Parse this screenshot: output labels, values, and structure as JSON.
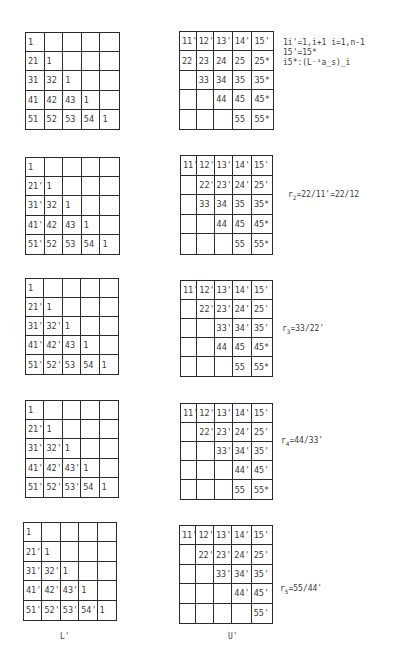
{
  "steps": [
    {
      "L": [
        [
          "1",
          "",
          "",
          "",
          ""
        ],
        [
          "21",
          "1",
          "",
          "",
          ""
        ],
        [
          "31",
          "32",
          "1",
          "",
          ""
        ],
        [
          "41",
          "42",
          "43",
          "1",
          ""
        ],
        [
          "51",
          "52",
          "53",
          "54",
          "1"
        ]
      ],
      "U": [
        [
          "11'",
          "12'",
          "13'",
          "14'",
          "15'"
        ],
        [
          "22",
          "23",
          "24",
          "25",
          "25*"
        ],
        [
          "",
          "33",
          "34",
          "35",
          "35*"
        ],
        [
          "",
          "",
          "44",
          "45",
          "45*"
        ],
        [
          "",
          "",
          "",
          "55",
          "55*"
        ]
      ],
      "note_lines": [
        "1i'=1,i+1 i=1,n-1",
        "15'=15*",
        "i5*:(L⁻¹a_s)_i"
      ]
    },
    {
      "L": [
        [
          "1",
          "",
          "",
          "",
          ""
        ],
        [
          "21'",
          "1",
          "",
          "",
          ""
        ],
        [
          "31'",
          "32",
          "1",
          "",
          ""
        ],
        [
          "41'",
          "42",
          "43",
          "1",
          ""
        ],
        [
          "51'",
          "52",
          "53",
          "54",
          "1"
        ]
      ],
      "U": [
        [
          "11'",
          "12'",
          "13'",
          "14'",
          "15'"
        ],
        [
          "",
          "22'",
          "23'",
          "24'",
          "25'"
        ],
        [
          "",
          "33",
          "34",
          "35",
          "35*"
        ],
        [
          "",
          "",
          "44",
          "45",
          "45*"
        ],
        [
          "",
          "",
          "",
          "55",
          "55*"
        ]
      ],
      "note": {
        "r": "r",
        "sub": "2",
        "expr": "=22/11'=22/12"
      }
    },
    {
      "L": [
        [
          "1",
          "",
          "",
          "",
          ""
        ],
        [
          "21'",
          "1",
          "",
          "",
          ""
        ],
        [
          "31'",
          "32'",
          "1",
          "",
          ""
        ],
        [
          "41'",
          "42'",
          "43",
          "1",
          ""
        ],
        [
          "51'",
          "52'",
          "53",
          "54",
          "1"
        ]
      ],
      "U": [
        [
          "11'",
          "12'",
          "13'",
          "14'",
          "15'"
        ],
        [
          "",
          "22'",
          "23'",
          "24'",
          "25'"
        ],
        [
          "",
          "",
          "33'",
          "34'",
          "35'"
        ],
        [
          "",
          "",
          "44",
          "45",
          "45*"
        ],
        [
          "",
          "",
          "",
          "55",
          "55*"
        ]
      ],
      "note": {
        "r": "r",
        "sub": "3",
        "expr": "=33/22'"
      }
    },
    {
      "L": [
        [
          "1",
          "",
          "",
          "",
          ""
        ],
        [
          "21'",
          "1",
          "",
          "",
          ""
        ],
        [
          "31'",
          "32'",
          "1",
          "",
          ""
        ],
        [
          "41'",
          "42'",
          "43'",
          "1",
          ""
        ],
        [
          "51'",
          "52'",
          "53'",
          "54",
          "1"
        ]
      ],
      "U": [
        [
          "11'",
          "12'",
          "13'",
          "14'",
          "15'"
        ],
        [
          "",
          "22'",
          "23'",
          "24'",
          "25'"
        ],
        [
          "",
          "",
          "33'",
          "34'",
          "35'"
        ],
        [
          "",
          "",
          "",
          "44'",
          "45'"
        ],
        [
          "",
          "",
          "",
          "55",
          "55*"
        ]
      ],
      "note": {
        "r": "r",
        "sub": "4",
        "expr": "=44/33'"
      }
    },
    {
      "L": [
        [
          "1",
          "",
          "",
          "",
          ""
        ],
        [
          "21'",
          "1",
          "",
          "",
          ""
        ],
        [
          "31'",
          "32'",
          "1",
          "",
          ""
        ],
        [
          "41'",
          "42'",
          "43'",
          "1",
          ""
        ],
        [
          "51'",
          "52'",
          "53'",
          "54'",
          "1"
        ]
      ],
      "U": [
        [
          "11'",
          "12'",
          "13'",
          "14'",
          "15'"
        ],
        [
          "",
          "22'",
          "23'",
          "24'",
          "25'"
        ],
        [
          "",
          "",
          "33'",
          "34'",
          "35'"
        ],
        [
          "",
          "",
          "",
          "44'",
          "45'"
        ],
        [
          "",
          "",
          "",
          "",
          "55'"
        ]
      ],
      "note": {
        "r": "r",
        "sub": "5",
        "expr": "=55/44'"
      }
    }
  ],
  "captions": {
    "L": "L'",
    "U": "U'"
  }
}
